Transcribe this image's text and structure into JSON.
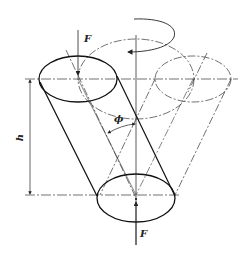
{
  "diagram": {
    "type": "engineering-schematic",
    "labels": {
      "force_top": "F",
      "force_bottom": "F",
      "height": "h",
      "angle": "ϕ"
    },
    "colors": {
      "line": "#222222",
      "background": "#ffffff"
    }
  }
}
